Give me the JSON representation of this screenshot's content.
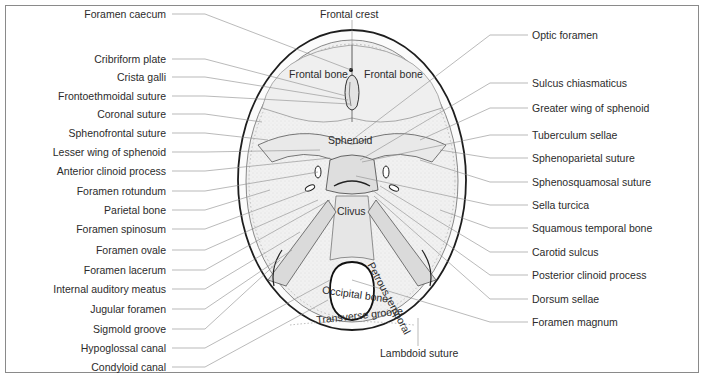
{
  "figure": {
    "left_labels": [
      {
        "text": "Foramen caecum",
        "y": 14
      },
      {
        "text": "Cribriform plate",
        "y": 59
      },
      {
        "text": "Crista galli",
        "y": 77
      },
      {
        "text": "Frontoethmoidal suture",
        "y": 96
      },
      {
        "text": "Coronal suture",
        "y": 114
      },
      {
        "text": "Sphenofrontal suture",
        "y": 133
      },
      {
        "text": "Lesser wing of sphenoid",
        "y": 152
      },
      {
        "text": "Anterior clinoid process",
        "y": 171
      },
      {
        "text": "Foramen rotundum",
        "y": 191
      },
      {
        "text": "Parietal bone",
        "y": 210
      },
      {
        "text": "Foramen spinosum",
        "y": 229
      },
      {
        "text": "Foramen ovale",
        "y": 250
      },
      {
        "text": "Foramen lacerum",
        "y": 270
      },
      {
        "text": "Internal auditory meatus",
        "y": 289
      },
      {
        "text": "Jugular foramen",
        "y": 309
      },
      {
        "text": "Sigmold groove",
        "y": 329
      },
      {
        "text": "Hypoglossal canal",
        "y": 348
      },
      {
        "text": "Condyloid canal",
        "y": 367
      }
    ],
    "right_labels": [
      {
        "text": "Optic foramen",
        "y": 35
      },
      {
        "text": "Sulcus chiasmaticus",
        "y": 83
      },
      {
        "text": "Greater wing of sphenoid",
        "y": 108
      },
      {
        "text": "Tuberculum sellae",
        "y": 135
      },
      {
        "text": "Sphenoparietal suture",
        "y": 158
      },
      {
        "text": "Sphenosquamosal suture",
        "y": 182
      },
      {
        "text": "Sella turcica",
        "y": 205
      },
      {
        "text": "Squamous temporal bone",
        "y": 228
      },
      {
        "text": "Carotid sulcus",
        "y": 252
      },
      {
        "text": "Posterior clinoid process",
        "y": 275
      },
      {
        "text": "Dorsum sellae",
        "y": 299
      },
      {
        "text": "Foramen magnum",
        "y": 322
      }
    ],
    "top_label": "Frontal crest",
    "bottom_label": "Lambdoid suture",
    "inner_labels": {
      "frontal_bone_left": "Frontal bone",
      "frontal_bone_right": "Frontal bone",
      "sphenoid": "Sphenoid",
      "clivus": "Clivus",
      "petrous_temporal": "Petrous temporal",
      "occipital_bone": "Occipital bone",
      "transverse_groove": "Transverse groove"
    }
  }
}
